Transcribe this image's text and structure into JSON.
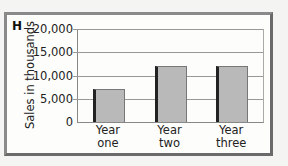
{
  "figure": {
    "panel_label": "H"
  },
  "chart_data": {
    "type": "bar",
    "title": "",
    "xlabel": "",
    "ylabel": "Sales in thousands",
    "categories": [
      "Year one",
      "Year two",
      "Year three"
    ],
    "category_lines": [
      [
        "Year",
        "one"
      ],
      [
        "Year",
        "two"
      ],
      [
        "Year",
        "three"
      ]
    ],
    "values": [
      7000,
      12000,
      12000
    ],
    "ylim": [
      0,
      20000
    ],
    "yticks": [
      0,
      5000,
      10000,
      15000,
      20000
    ],
    "ytick_labels": [
      "0",
      "5,000",
      "10,000",
      "15,000",
      "20,000"
    ],
    "grid": true,
    "legend": null,
    "colors": {
      "bar_fill": "#b9b9b9",
      "bar_edge": "#222222",
      "frame": "#7a7a7a"
    }
  }
}
